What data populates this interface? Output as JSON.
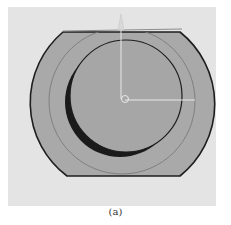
{
  "figure": {
    "caption": "(a)",
    "colors": {
      "background_panel": "#e4e4e4",
      "part_fill": "#a9a9a9",
      "inner_fill": "#a6a6a6",
      "outline": "#1e1e1e",
      "middle_circle": "#7a7a7a",
      "shadow_crescent": "#1a1a1a",
      "axis": "#e8e8e8"
    },
    "axes": {
      "origin": [
        125,
        99
      ],
      "vertical_axis_top": [
        121,
        15
      ],
      "horizontal_axis_end": [
        195,
        100
      ]
    }
  }
}
